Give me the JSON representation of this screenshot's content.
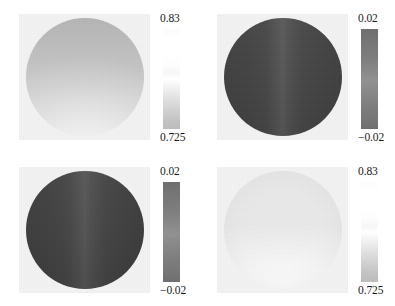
{
  "figure": {
    "type": "image-grid",
    "rows": 2,
    "columns": 2,
    "background_color": "#ffffff",
    "panel_background_color": "#f3f3f3",
    "colormap": "grayscale"
  },
  "chart_data": {
    "type": "heatmap",
    "title": "",
    "xlabel": "",
    "ylabel": "",
    "grid": false,
    "legend_position": "right-of-each-panel",
    "panels": [
      {
        "id": "panel-top-left",
        "position": "top-left",
        "shape": "circular-disc",
        "colorbar": {
          "orientation": "vertical",
          "max_label": "0.83",
          "max_value": 0.83,
          "min_label": "0.725",
          "min_value": 0.725,
          "high_color": "#ffffff",
          "low_color": "#bcbcbc"
        },
        "field_description": "light gray disc, darker toward top, brighter toward bottom"
      },
      {
        "id": "panel-top-right",
        "position": "top-right",
        "shape": "circular-disc",
        "colorbar": {
          "orientation": "vertical",
          "max_label": "0.02",
          "max_value": 0.02,
          "min_label": "−0.02",
          "min_value": -0.02,
          "high_color": "#6f6f6f",
          "low_color": "#6e6e6e"
        },
        "field_description": "mid gray disc with vertical lighter band near center"
      },
      {
        "id": "panel-bottom-left",
        "position": "bottom-left",
        "shape": "circular-disc",
        "colorbar": {
          "orientation": "vertical",
          "max_label": "0.02",
          "max_value": 0.02,
          "min_label": "−0.02",
          "min_value": -0.02,
          "high_color": "#6f6f6f",
          "low_color": "#6e6e6e"
        },
        "field_description": "mid gray disc with vertical lighter band near center"
      },
      {
        "id": "panel-bottom-right",
        "position": "bottom-right",
        "shape": "circular-disc",
        "colorbar": {
          "orientation": "vertical",
          "max_label": "0.83",
          "max_value": 0.83,
          "min_label": "0.725",
          "min_value": 0.725,
          "high_color": "#ffffff",
          "low_color": "#bcbcbc"
        },
        "field_description": "near white disc with faint gray rim shading"
      }
    ]
  }
}
